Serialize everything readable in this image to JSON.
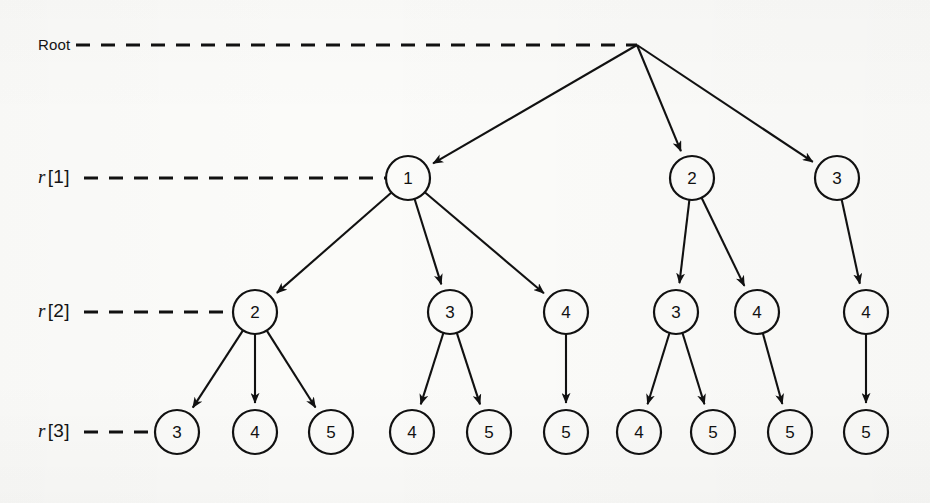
{
  "figure": {
    "kind": "tree-diagram",
    "width": 930,
    "height": 503,
    "background_color": "#fbfbf9",
    "ink_color": "#111111"
  },
  "labels": {
    "root": "Root",
    "levels": [
      {
        "symbol": "r",
        "index": "[1]",
        "text": "r [1]"
      },
      {
        "symbol": "r",
        "index": "[2]",
        "text": "r [2]"
      },
      {
        "symbol": "r",
        "index": "[3]",
        "text": "r [3]"
      }
    ]
  },
  "chart_data": {
    "type": "diagram",
    "title": "",
    "levels": [
      "Root",
      "r [1]",
      "r [2]",
      "r [3]"
    ],
    "level_y": [
      45,
      178,
      312,
      432
    ],
    "nodes": [
      {
        "id": "root",
        "label": "",
        "level": 0,
        "x": 637,
        "y": 45,
        "shape": "point"
      },
      {
        "id": "n1",
        "label": "1",
        "level": 1,
        "x": 408,
        "y": 178,
        "shape": "circle"
      },
      {
        "id": "n2",
        "label": "2",
        "level": 1,
        "x": 692,
        "y": 178,
        "shape": "circle"
      },
      {
        "id": "n3",
        "label": "3",
        "level": 1,
        "x": 837,
        "y": 178,
        "shape": "circle"
      },
      {
        "id": "m1",
        "label": "2",
        "level": 2,
        "x": 255,
        "y": 312,
        "shape": "circle"
      },
      {
        "id": "m2",
        "label": "3",
        "level": 2,
        "x": 450,
        "y": 312,
        "shape": "circle"
      },
      {
        "id": "m3",
        "label": "4",
        "level": 2,
        "x": 566,
        "y": 312,
        "shape": "circle"
      },
      {
        "id": "m4",
        "label": "3",
        "level": 2,
        "x": 676,
        "y": 312,
        "shape": "circle"
      },
      {
        "id": "m5",
        "label": "4",
        "level": 2,
        "x": 757,
        "y": 312,
        "shape": "circle"
      },
      {
        "id": "m6",
        "label": "4",
        "level": 2,
        "x": 866,
        "y": 312,
        "shape": "circle"
      },
      {
        "id": "b1",
        "label": "3",
        "level": 3,
        "x": 177,
        "y": 432,
        "shape": "circle"
      },
      {
        "id": "b2",
        "label": "4",
        "level": 3,
        "x": 255,
        "y": 432,
        "shape": "circle"
      },
      {
        "id": "b3",
        "label": "5",
        "level": 3,
        "x": 331,
        "y": 432,
        "shape": "circle"
      },
      {
        "id": "b4",
        "label": "4",
        "level": 3,
        "x": 412,
        "y": 432,
        "shape": "circle"
      },
      {
        "id": "b5",
        "label": "5",
        "level": 3,
        "x": 489,
        "y": 432,
        "shape": "circle"
      },
      {
        "id": "b6",
        "label": "5",
        "level": 3,
        "x": 566,
        "y": 432,
        "shape": "circle"
      },
      {
        "id": "b7",
        "label": "4",
        "level": 3,
        "x": 639,
        "y": 432,
        "shape": "circle"
      },
      {
        "id": "b8",
        "label": "5",
        "level": 3,
        "x": 713,
        "y": 432,
        "shape": "circle"
      },
      {
        "id": "b9",
        "label": "5",
        "level": 3,
        "x": 790,
        "y": 432,
        "shape": "circle"
      },
      {
        "id": "b10",
        "label": "5",
        "level": 3,
        "x": 866,
        "y": 432,
        "shape": "circle"
      }
    ],
    "edges": [
      {
        "from": "root",
        "to": "n1"
      },
      {
        "from": "root",
        "to": "n2"
      },
      {
        "from": "root",
        "to": "n3"
      },
      {
        "from": "n1",
        "to": "m1"
      },
      {
        "from": "n1",
        "to": "m2"
      },
      {
        "from": "n1",
        "to": "m3"
      },
      {
        "from": "n2",
        "to": "m4"
      },
      {
        "from": "n2",
        "to": "m5"
      },
      {
        "from": "n3",
        "to": "m6"
      },
      {
        "from": "m1",
        "to": "b1"
      },
      {
        "from": "m1",
        "to": "b2"
      },
      {
        "from": "m1",
        "to": "b3"
      },
      {
        "from": "m2",
        "to": "b4"
      },
      {
        "from": "m2",
        "to": "b5"
      },
      {
        "from": "m3",
        "to": "b6"
      },
      {
        "from": "m4",
        "to": "b7"
      },
      {
        "from": "m4",
        "to": "b8"
      },
      {
        "from": "m5",
        "to": "b9"
      },
      {
        "from": "m6",
        "to": "b10"
      }
    ],
    "guide_lines": [
      {
        "label": "Root",
        "y": 45,
        "x_start": 76,
        "x_end": 637,
        "style": "dashed"
      },
      {
        "label": "r [1]",
        "y": 178,
        "x_start": 84,
        "x_end": 385,
        "style": "dashed"
      },
      {
        "label": "r [2]",
        "y": 312,
        "x_start": 84,
        "x_end": 232,
        "style": "dashed"
      },
      {
        "label": "r [3]",
        "y": 432,
        "x_start": 84,
        "x_end": 154,
        "style": "dashed"
      }
    ],
    "node_radius": 22,
    "grid": false,
    "legend": null
  }
}
